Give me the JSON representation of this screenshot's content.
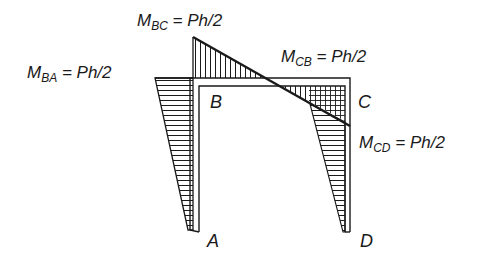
{
  "diagram": {
    "type": "bending-moment-diagram",
    "structure": "portal frame",
    "nodes": [
      {
        "id": "A",
        "label": "A"
      },
      {
        "id": "B",
        "label": "B"
      },
      {
        "id": "C",
        "label": "C"
      },
      {
        "id": "D",
        "label": "D"
      }
    ],
    "moments": [
      {
        "id": "M_BC",
        "symbol": "M",
        "subscript": "BC",
        "value": "= Ph/2"
      },
      {
        "id": "M_BA",
        "symbol": "M",
        "subscript": "BA",
        "value": "= Ph/2"
      },
      {
        "id": "M_CB",
        "symbol": "M",
        "subscript": "CB",
        "value": "= Ph/2"
      },
      {
        "id": "M_CD",
        "symbol": "M",
        "subscript": "CD",
        "value": "= Ph/2"
      }
    ],
    "colors": {
      "line": "#1a1a1a",
      "background": "#ffffff"
    }
  }
}
